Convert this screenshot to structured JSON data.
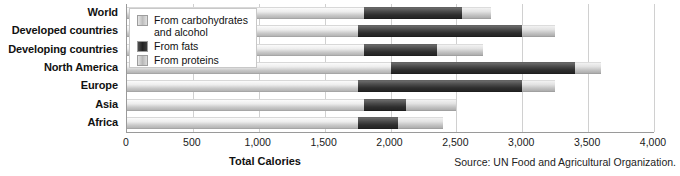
{
  "chart_data": {
    "type": "bar",
    "orientation": "horizontal",
    "stacked": true,
    "title": "",
    "xlabel": "Total Calories",
    "ylabel": "",
    "xlim": [
      0,
      4000
    ],
    "xticks": [
      "0",
      "500",
      "1,000",
      "1,500",
      "2,000",
      "2,500",
      "3,000",
      "3,500",
      "4,000"
    ],
    "xtick_values": [
      0,
      500,
      1000,
      1500,
      2000,
      2500,
      3000,
      3500,
      4000
    ],
    "grid": "vertical",
    "legend_position": "top-left (overlaps plot)",
    "categories": [
      "World",
      "Developed countries",
      "Developing countries",
      "North America",
      "Europe",
      "Asia",
      "Africa"
    ],
    "series": [
      {
        "name": "From carbohydrates and alcohol",
        "values": [
          1800,
          1750,
          1800,
          2000,
          1750,
          1800,
          1750
        ]
      },
      {
        "name": "From fats",
        "values": [
          740,
          1250,
          550,
          1400,
          1250,
          320,
          310
        ]
      },
      {
        "name": "From proteins",
        "values": [
          220,
          250,
          350,
          200,
          250,
          380,
          340
        ]
      }
    ],
    "totals": [
      2760,
      3250,
      2700,
      3600,
      3250,
      2500,
      2400
    ],
    "source": "Source: UN Food and Agricultural Organization.",
    "colors": {
      "carbohydrates": "#d9d9d9",
      "fats": "#333333",
      "proteins": "#cfcfcf",
      "gridline": "#d0d0d0",
      "axis": "#9a9a9a"
    }
  },
  "legend": {
    "items": [
      {
        "label": "From carbohydrates and alcohol",
        "swatch": "carb"
      },
      {
        "label": "From fats",
        "swatch": "fat"
      },
      {
        "label": "From proteins",
        "swatch": "prot"
      }
    ]
  },
  "footer": {
    "axis_title": "Total Calories",
    "source": "Source: UN Food and Agricultural Organization."
  }
}
